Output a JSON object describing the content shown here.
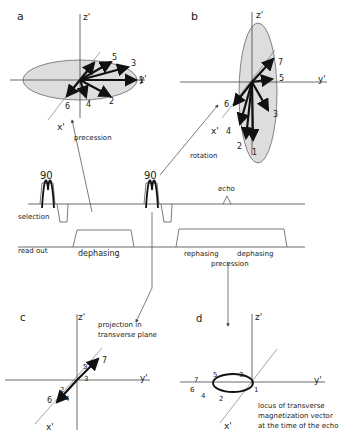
{
  "panels": {
    "a": {
      "label": "a",
      "axes": {
        "z": "z'",
        "y": "y'",
        "x": "x'"
      },
      "vectors": [
        "1",
        "2",
        "3",
        "4",
        "5",
        "6"
      ]
    },
    "b": {
      "label": "b",
      "axes": {
        "z": "z'",
        "y": "y'",
        "x": "x'"
      },
      "vectors": [
        "1",
        "2",
        "3",
        "4",
        "5",
        "6",
        "7"
      ]
    },
    "c": {
      "label": "c",
      "axes": {
        "z": "z'",
        "y": "y'",
        "x": "x'"
      },
      "vectors": [
        "2",
        "3",
        "4",
        "5",
        "6",
        "7"
      ]
    },
    "d": {
      "label": "d",
      "axes": {
        "z": "z'",
        "y": "y'",
        "x": "x'"
      },
      "vectors": [
        "1",
        "2",
        "3",
        "4",
        "5",
        "6",
        "7"
      ]
    }
  },
  "annotations": {
    "precession_top": "precession",
    "rotation": "rotation",
    "projection_line1": "projection in",
    "projection_line2": "transverse plane",
    "locus_line1": "locus of transverse",
    "locus_line2": "magnetization vector",
    "locus_line3": "at the time of the echo"
  },
  "sequence": {
    "pulse1": "90",
    "pulse2": "90",
    "selection": "selection",
    "read_out": "read out",
    "echo": "echo",
    "dephasing1": "dephasing",
    "rephasing": "rephasing",
    "dephasing2": "dephasing",
    "precession": "precession"
  }
}
